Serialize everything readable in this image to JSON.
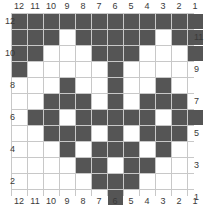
{
  "chart_data": {
    "type": "heatmap",
    "title": "",
    "subtitle": "",
    "xlabel": "",
    "ylabel": "",
    "grid": true,
    "legend": "none",
    "colors": {
      "filled": "#555555",
      "empty": "#ffffff",
      "gridline": "#c8c8c8",
      "label": "#3a3a3a"
    },
    "columns": 12,
    "rows": 12,
    "x_tick_labels_top": [
      "12",
      "11",
      "10",
      "9",
      "8",
      "7",
      "6",
      "5",
      "4",
      "3",
      "2",
      "1"
    ],
    "x_tick_labels_bottom": [
      "12",
      "11",
      "10",
      "9",
      "8",
      "7",
      "6",
      "5",
      "4",
      "3",
      "2",
      "1"
    ],
    "y_tick_labels_left": [
      "12",
      "10",
      "8",
      "6",
      "4",
      "2"
    ],
    "y_tick_labels_right": [
      "11",
      "9",
      "7",
      "5",
      "3",
      "1"
    ],
    "y_tick_rows_left": [
      12,
      10,
      8,
      6,
      4,
      2
    ],
    "y_tick_rows_right": [
      11,
      9,
      7,
      5,
      3,
      1
    ],
    "row_order_top_to_bottom": [
      12,
      11,
      10,
      9,
      8,
      7,
      6,
      5,
      4,
      3,
      2,
      1
    ],
    "column_order_left_to_right": [
      12,
      11,
      10,
      9,
      8,
      7,
      6,
      5,
      4,
      3,
      2,
      1
    ],
    "values": [
      [
        1,
        1,
        1,
        1,
        1,
        1,
        1,
        1,
        1,
        1,
        1,
        1
      ],
      [
        1,
        1,
        1,
        0,
        1,
        1,
        1,
        1,
        1,
        0,
        1,
        1
      ],
      [
        1,
        1,
        0,
        0,
        0,
        1,
        1,
        1,
        0,
        0,
        0,
        1
      ],
      [
        1,
        0,
        0,
        0,
        0,
        0,
        1,
        0,
        0,
        0,
        0,
        0
      ],
      [
        0,
        0,
        0,
        1,
        0,
        0,
        1,
        0,
        0,
        1,
        0,
        0
      ],
      [
        0,
        0,
        1,
        1,
        1,
        0,
        1,
        0,
        1,
        1,
        1,
        0
      ],
      [
        0,
        1,
        1,
        0,
        1,
        1,
        1,
        1,
        1,
        0,
        1,
        1
      ],
      [
        0,
        0,
        1,
        1,
        1,
        0,
        1,
        0,
        1,
        1,
        1,
        0
      ],
      [
        0,
        0,
        0,
        1,
        0,
        1,
        1,
        1,
        0,
        1,
        0,
        0
      ],
      [
        0,
        0,
        0,
        0,
        1,
        1,
        0,
        1,
        1,
        0,
        0,
        0
      ],
      [
        0,
        0,
        0,
        0,
        0,
        1,
        1,
        1,
        0,
        0,
        0,
        0
      ],
      [
        0,
        0,
        0,
        0,
        0,
        0,
        1,
        0,
        0,
        0,
        0,
        0
      ]
    ],
    "filled_cells_by_row": {
      "12": [
        12,
        11,
        10,
        9,
        8,
        7,
        6,
        5,
        4,
        3,
        2,
        1
      ],
      "11": [
        12,
        11,
        10,
        8,
        7,
        6,
        5,
        4,
        2,
        1
      ],
      "10": [
        12,
        11,
        7,
        6,
        5,
        1
      ],
      "9": [
        12,
        6
      ],
      "8": [
        9,
        6,
        3
      ],
      "7": [
        10,
        9,
        8,
        6,
        4,
        3,
        2
      ],
      "6": [
        11,
        10,
        8,
        7,
        6,
        5,
        4,
        2,
        1
      ],
      "5": [
        10,
        9,
        8,
        6,
        4,
        3,
        2
      ],
      "4": [
        9,
        7,
        6,
        5,
        3
      ],
      "3": [
        8,
        7,
        5,
        4
      ],
      "2": [
        7,
        6,
        5
      ],
      "1": [
        6
      ]
    },
    "filled_count": 63,
    "total_cells": 144
  }
}
